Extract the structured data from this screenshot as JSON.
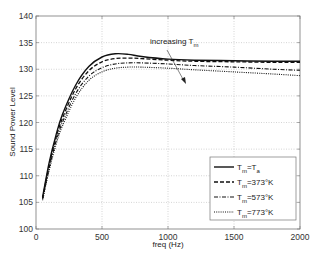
{
  "chart_data": {
    "type": "line",
    "title": "",
    "xlabel": "freq (Hz)",
    "ylabel": "Sound Power Level",
    "xlim": [
      0,
      2000
    ],
    "ylim": [
      100,
      140
    ],
    "xticks": [
      0,
      500,
      1000,
      1500,
      2000
    ],
    "yticks": [
      100,
      105,
      110,
      115,
      120,
      125,
      130,
      135,
      140
    ],
    "grid": true,
    "legend_position": "lower right",
    "annotation": {
      "text": "increasing T",
      "subscript": "m",
      "arrow": "pointing down-right across curves"
    },
    "x": [
      50,
      100,
      150,
      200,
      300,
      400,
      500,
      600,
      700,
      800,
      1000,
      1200,
      1500,
      1800,
      2000
    ],
    "series": [
      {
        "name": "T_m=T_a",
        "legend_main": "T",
        "legend_sub": "m",
        "legend_rest": "=T",
        "legend_sub2": "a",
        "style": "solid",
        "values": [
          106.0,
          112.5,
          117.5,
          121.5,
          127.0,
          130.5,
          132.3,
          132.9,
          132.8,
          132.4,
          131.9,
          131.7,
          131.6,
          131.5,
          131.5
        ]
      },
      {
        "name": "T_m=373°K",
        "legend_main": "T",
        "legend_sub": "m",
        "legend_rest": "=373°K",
        "legend_sub2": "",
        "style": "dashed",
        "values": [
          105.8,
          112.0,
          117.0,
          120.8,
          126.3,
          129.7,
          131.4,
          132.0,
          132.1,
          132.0,
          131.7,
          131.5,
          131.4,
          131.3,
          131.3
        ]
      },
      {
        "name": "T_m=573°K",
        "legend_main": "T",
        "legend_sub": "m",
        "legend_rest": "=573°K",
        "legend_sub2": "",
        "style": "dashdot",
        "values": [
          105.6,
          111.5,
          116.3,
          120.0,
          125.4,
          128.7,
          130.3,
          131.0,
          131.2,
          131.2,
          131.0,
          130.7,
          130.4,
          130.0,
          129.8
        ]
      },
      {
        "name": "T_m=773°K",
        "legend_main": "T",
        "legend_sub": "m",
        "legend_rest": "=773°K",
        "legend_sub2": "",
        "style": "dotted",
        "values": [
          105.4,
          111.0,
          115.7,
          119.3,
          124.6,
          127.9,
          129.5,
          130.2,
          130.4,
          130.4,
          130.2,
          129.9,
          129.5,
          129.1,
          128.8
        ]
      }
    ]
  },
  "colors": {
    "line": "#111111",
    "axis": "#777777",
    "grid": "#aaaaaa",
    "background": "#ffffff"
  }
}
